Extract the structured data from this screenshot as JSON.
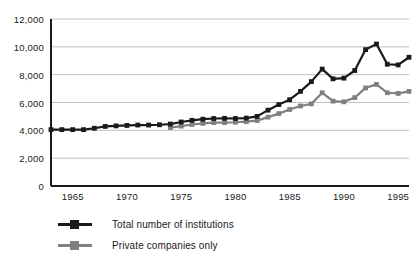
{
  "chart_data": {
    "type": "line",
    "title": "",
    "subtitle": "",
    "xlabel": "",
    "ylabel": "",
    "xlim": [
      1963,
      1996
    ],
    "ylim": [
      0,
      12000
    ],
    "grid": "horizontal",
    "legend_position": "bottom-left",
    "y_ticks": [
      0,
      2000,
      4000,
      6000,
      8000,
      10000,
      12000
    ],
    "y_tick_labels": [
      "0",
      "2,000",
      "4,000",
      "6,000",
      "8,000",
      "10,000",
      "12,000"
    ],
    "x_ticks": [
      1965,
      1970,
      1975,
      1980,
      1985,
      1990,
      1995
    ],
    "x_tick_labels": [
      "1965",
      "1970",
      "1975",
      "1980",
      "1985",
      "1990",
      "1995"
    ],
    "series": [
      {
        "name": "Total number of institutions",
        "color": "#1a1a1a",
        "marker": "square",
        "x": [
          1963,
          1964,
          1965,
          1966,
          1967,
          1968,
          1969,
          1970,
          1971,
          1972,
          1973,
          1974,
          1975,
          1976,
          1977,
          1978,
          1979,
          1980,
          1981,
          1982,
          1983,
          1984,
          1985,
          1986,
          1987,
          1988,
          1989,
          1990,
          1991,
          1992,
          1993,
          1994,
          1995,
          1996
        ],
        "values": [
          4050,
          4050,
          4050,
          4050,
          4150,
          4280,
          4320,
          4350,
          4380,
          4380,
          4400,
          4450,
          4600,
          4720,
          4800,
          4850,
          4860,
          4850,
          4880,
          5000,
          5450,
          5850,
          6200,
          6800,
          7500,
          8400,
          7700,
          7750,
          8300,
          9800,
          10200,
          8750,
          8700,
          9250
        ]
      },
      {
        "name": "Private companies only",
        "color": "#808080",
        "marker": "square",
        "x": [
          1974,
          1975,
          1976,
          1977,
          1978,
          1979,
          1980,
          1981,
          1982,
          1983,
          1984,
          1985,
          1986,
          1987,
          1988,
          1989,
          1990,
          1991,
          1992,
          1993,
          1994,
          1995,
          1996
        ],
        "values": [
          4200,
          4300,
          4420,
          4500,
          4550,
          4560,
          4580,
          4620,
          4700,
          4950,
          5200,
          5500,
          5750,
          5900,
          6700,
          6100,
          6050,
          6350,
          7050,
          7300,
          6700,
          6650,
          6800
        ]
      }
    ]
  },
  "legend": {
    "items": [
      {
        "label": "Total number of institutions",
        "color": "#1a1a1a"
      },
      {
        "label": "Private companies only",
        "color": "#808080"
      }
    ]
  }
}
